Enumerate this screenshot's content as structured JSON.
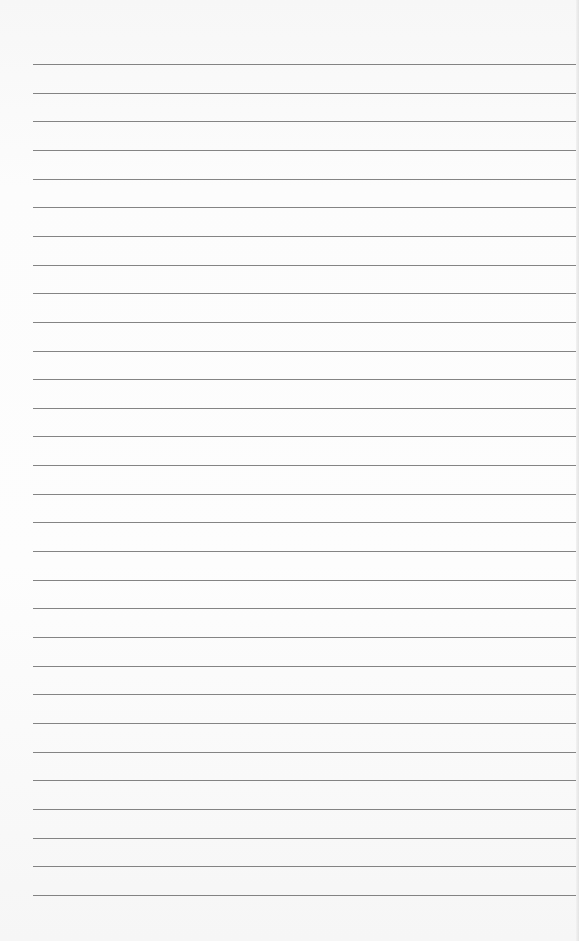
{
  "paper": {
    "type": "lined-paper",
    "line_count": 30,
    "first_line_y": 64,
    "line_spacing": 28.65,
    "line_left": 33,
    "line_color": "#6e6e6e",
    "background": "#fbfbfb"
  }
}
